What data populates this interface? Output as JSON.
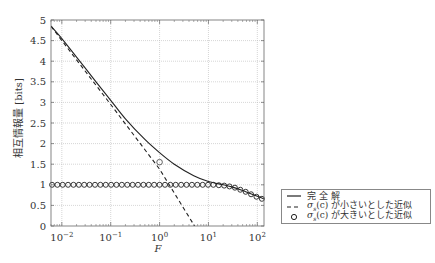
{
  "chart_data": {
    "type": "line",
    "title": "",
    "xlabel": "F",
    "ylabel": "相互情報量 [bits]",
    "xscale": "log",
    "xlim": [
      0.006,
      137
    ],
    "ylim": [
      0,
      5
    ],
    "grid": true,
    "legend_position": "outside-right-bottom",
    "x_ticks": [
      {
        "value": 0.01,
        "label_base": "10",
        "label_exp": "−2"
      },
      {
        "value": 0.1,
        "label_base": "10",
        "label_exp": "−1"
      },
      {
        "value": 1,
        "label_base": "10",
        "label_exp": "0"
      },
      {
        "value": 10,
        "label_base": "10",
        "label_exp": "1"
      },
      {
        "value": 100,
        "label_base": "10",
        "label_exp": "2"
      }
    ],
    "y_ticks": [
      {
        "value": 0,
        "label": "0"
      },
      {
        "value": 0.5,
        "label": "0.5"
      },
      {
        "value": 1,
        "label": "1"
      },
      {
        "value": 1.5,
        "label": "1.5"
      },
      {
        "value": 2,
        "label": "2"
      },
      {
        "value": 2.5,
        "label": "2.5"
      },
      {
        "value": 3,
        "label": "3"
      },
      {
        "value": 3.5,
        "label": "3.5"
      },
      {
        "value": 4,
        "label": "4"
      },
      {
        "value": 4.5,
        "label": "4.5"
      },
      {
        "value": 5,
        "label": "5"
      }
    ],
    "series": [
      {
        "name": "完全解",
        "style": "solid",
        "x": [
          0.006,
          0.01,
          0.02,
          0.05,
          0.1,
          0.2,
          0.5,
          1,
          2,
          5,
          10,
          20,
          30,
          50,
          100,
          137
        ],
        "y": [
          4.85,
          4.55,
          4.1,
          3.5,
          3.05,
          2.6,
          2.1,
          1.78,
          1.5,
          1.22,
          1.08,
          1.0,
          0.95,
          0.86,
          0.72,
          0.66
        ]
      },
      {
        "name": "σs(c) が小さいとした近似",
        "style": "dashed",
        "x": [
          0.006,
          0.01,
          0.1,
          1,
          5.2
        ],
        "y": [
          4.85,
          4.5,
          2.95,
          1.38,
          0.0
        ]
      },
      {
        "name": "σs(c) が大きいとした近似",
        "style": "circles",
        "x": [
          0.0063,
          0.0081,
          0.0104,
          0.0134,
          0.0173,
          0.0223,
          0.0287,
          0.037,
          0.0477,
          0.0615,
          0.0792,
          0.102,
          0.131,
          0.169,
          0.218,
          0.281,
          0.362,
          0.467,
          0.601,
          0.775,
          1.0,
          1.29,
          1.66,
          2.14,
          2.76,
          3.56,
          4.59,
          5.91,
          7.62,
          9.82,
          12.6,
          16.3,
          21.0,
          27.0,
          34.8,
          44.9,
          57.8,
          74.5,
          96.0,
          124
        ],
        "y": [
          1,
          1,
          1,
          1,
          1,
          1,
          1,
          1,
          1,
          1,
          1,
          1,
          1,
          1,
          1,
          1,
          1,
          1,
          1,
          1,
          1,
          1,
          1,
          1,
          1,
          1,
          1,
          1,
          1,
          1,
          1,
          0.99,
          0.98,
          0.96,
          0.93,
          0.88,
          0.83,
          0.77,
          0.71,
          0.66
        ]
      }
    ],
    "annotations": [
      {
        "type": "outlier-circle",
        "x": 1,
        "y": 1.55
      }
    ]
  },
  "legend": {
    "items": [
      {
        "symbol": "solid-line",
        "label": "完 全 解"
      },
      {
        "symbol": "dashed-line",
        "label_sigma": "σ",
        "label_sub": "s",
        "label_rest": "(c) が小さいとした近似"
      },
      {
        "symbol": "circle-marker",
        "label_sigma": "σ",
        "label_sub": "s",
        "label_rest": "(c) が大きいとした近似"
      }
    ]
  }
}
